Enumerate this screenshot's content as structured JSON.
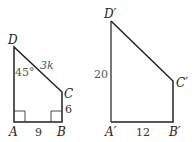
{
  "figures": [
    {
      "name": "ABCD",
      "vertices": {
        "A": {
          "label": "A",
          "x": 14,
          "y": 122
        },
        "B": {
          "label": "B",
          "x": 62,
          "y": 122
        },
        "C": {
          "label": "C",
          "x": 62,
          "y": 92
        },
        "D": {
          "label": "D",
          "x": 14,
          "y": 47
        }
      },
      "measures": {
        "AB": "9",
        "BC": "6",
        "CD": "3k",
        "angle_D": "45°"
      },
      "right_angles": [
        "A",
        "B"
      ]
    },
    {
      "name": "A'B'C'D'",
      "vertices": {
        "A": {
          "label": "A′",
          "x": 111,
          "y": 122
        },
        "B": {
          "label": "B′",
          "x": 173,
          "y": 122
        },
        "C": {
          "label": "C′",
          "x": 173,
          "y": 81
        },
        "D": {
          "label": "D′",
          "x": 111,
          "y": 21
        }
      },
      "measures": {
        "AD": "20",
        "AB": "12"
      }
    }
  ]
}
